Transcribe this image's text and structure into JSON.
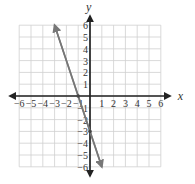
{
  "chart_data": {
    "type": "line",
    "title": "",
    "xlabel": "x",
    "ylabel": "y",
    "xlim": [
      -6,
      6
    ],
    "ylim": [
      -6,
      6
    ],
    "grid": true,
    "x_ticks": [
      "−6",
      "−5",
      "−4",
      "−3",
      "−2",
      "−1",
      "1",
      "2",
      "3",
      "4",
      "5",
      "6"
    ],
    "y_ticks": [
      "6",
      "5",
      "4",
      "3",
      "2",
      "1",
      "−1",
      "−2",
      "−3",
      "−4",
      "−5",
      "−6"
    ],
    "series": [
      {
        "name": "line",
        "equation": "y = -3x - 3",
        "x": [
          -3,
          -1,
          0,
          1
        ],
        "y": [
          6,
          0,
          -3,
          -6
        ],
        "color": "#777777",
        "arrows": "both"
      }
    ],
    "marked_points": [
      {
        "x": -1,
        "y": 0
      },
      {
        "x": 0,
        "y": -3
      }
    ]
  }
}
